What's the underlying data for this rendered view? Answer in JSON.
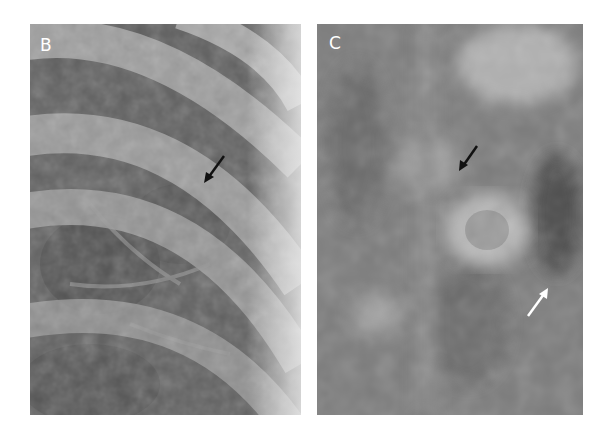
{
  "figure": {
    "panels": [
      {
        "label": "B",
        "description": "Chest radiograph detail with curved ribs; black arrow points to small lesion",
        "arrows": [
          {
            "color": "#111111",
            "direction": "down-left"
          }
        ]
      },
      {
        "label": "C",
        "description": "Tomogram detail with round opacity; black arrow above and white arrow below-right",
        "arrows": [
          {
            "color": "#111111",
            "direction": "down-left"
          },
          {
            "color": "#ffffff",
            "direction": "up-right"
          }
        ]
      }
    ]
  }
}
